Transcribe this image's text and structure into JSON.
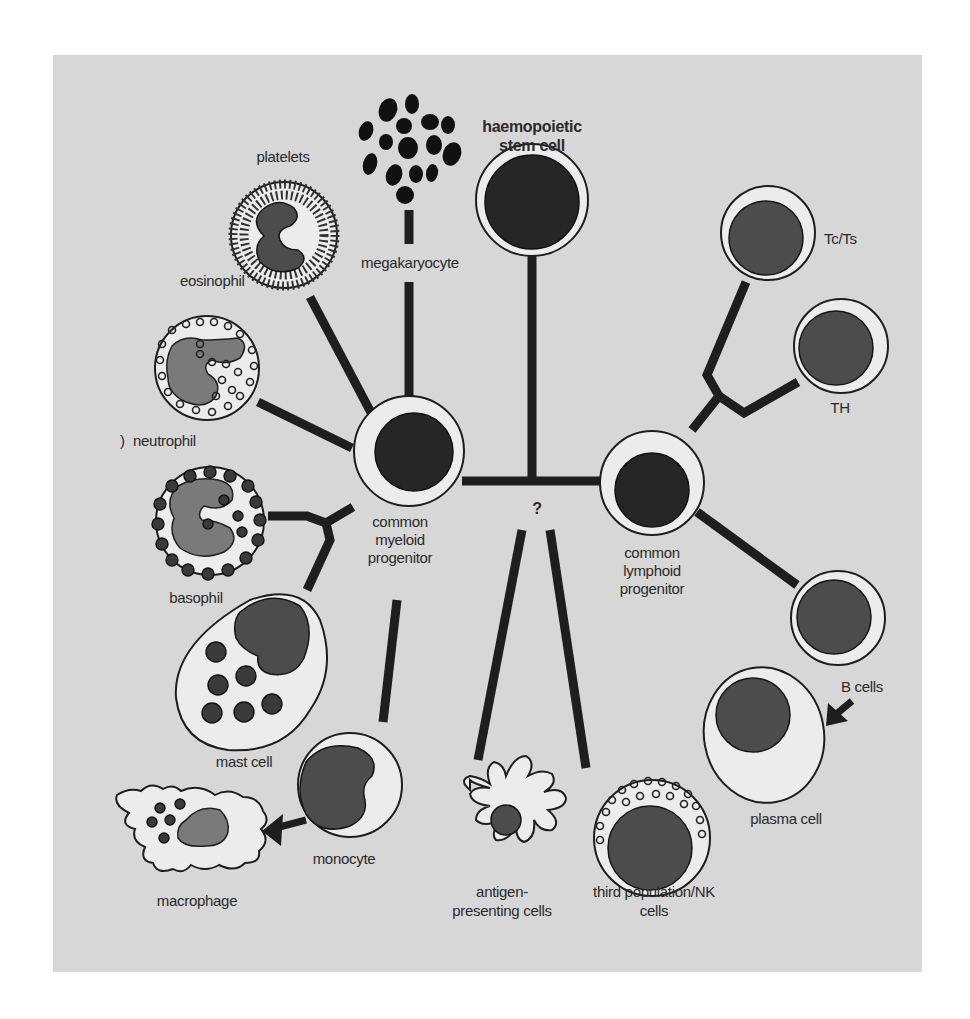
{
  "figure": {
    "panel_color": "#d7d7d7",
    "line_color": "#1e1e1e",
    "title": "",
    "root": {
      "label_line1": "haemopoietic",
      "label_line2": "stem cell"
    },
    "branch_question": "?",
    "myeloid": {
      "label_line1": "common",
      "label_line2": "myeloid",
      "label_line3": "progenitor",
      "children": {
        "platelets": "platelets",
        "megakaryocyte": "megakaryocyte",
        "eosinophil": "eosinophil",
        "neutrophil": "neutrophil",
        "basophil": "basophil",
        "mast_cell": "mast cell",
        "monocyte": "monocyte",
        "macrophage": "macrophage"
      }
    },
    "lymphoid": {
      "label_line1": "common",
      "label_line2": "lymphoid",
      "label_line3": "progenitor",
      "children": {
        "tc_ts": "Tc/Ts",
        "th": "TH",
        "b_cells": "B cells",
        "plasma_cell": "plasma cell"
      }
    },
    "other": {
      "apc_line1": "antigen-",
      "apc_line2": "presenting cells",
      "nk_line1": "third population/NK",
      "nk_line2": "cells"
    },
    "nodes": [
      {
        "id": "stem",
        "label": "haemopoietic stem cell"
      },
      {
        "id": "cmp",
        "label": "common myeloid progenitor"
      },
      {
        "id": "clp",
        "label": "common lymphoid progenitor"
      },
      {
        "id": "megakaryocyte",
        "label": "megakaryocyte"
      },
      {
        "id": "platelets",
        "label": "platelets"
      },
      {
        "id": "eosinophil",
        "label": "eosinophil"
      },
      {
        "id": "neutrophil",
        "label": "neutrophil"
      },
      {
        "id": "basophil",
        "label": "basophil"
      },
      {
        "id": "mast_cell",
        "label": "mast cell"
      },
      {
        "id": "monocyte",
        "label": "monocyte"
      },
      {
        "id": "macrophage",
        "label": "macrophage"
      },
      {
        "id": "apc",
        "label": "antigen-presenting cells"
      },
      {
        "id": "nk",
        "label": "third population/NK cells"
      },
      {
        "id": "tc_ts",
        "label": "Tc/Ts"
      },
      {
        "id": "th",
        "label": "TH"
      },
      {
        "id": "b_cells",
        "label": "B cells"
      },
      {
        "id": "plasma_cell",
        "label": "plasma cell"
      }
    ],
    "edges": [
      {
        "from": "stem",
        "to": "cmp"
      },
      {
        "from": "stem",
        "to": "clp"
      },
      {
        "from": "stem",
        "to": "apc",
        "note": "?"
      },
      {
        "from": "stem",
        "to": "nk",
        "note": "?"
      },
      {
        "from": "cmp",
        "to": "megakaryocyte"
      },
      {
        "from": "megakaryocyte",
        "to": "platelets"
      },
      {
        "from": "cmp",
        "to": "eosinophil"
      },
      {
        "from": "cmp",
        "to": "neutrophil"
      },
      {
        "from": "cmp",
        "to": "basophil"
      },
      {
        "from": "cmp",
        "to": "mast_cell"
      },
      {
        "from": "cmp",
        "to": "monocyte"
      },
      {
        "from": "monocyte",
        "to": "macrophage",
        "arrow": true
      },
      {
        "from": "clp",
        "to": "tc_ts"
      },
      {
        "from": "clp",
        "to": "th"
      },
      {
        "from": "clp",
        "to": "b_cells"
      },
      {
        "from": "b_cells",
        "to": "plasma_cell",
        "arrow": true
      }
    ]
  }
}
